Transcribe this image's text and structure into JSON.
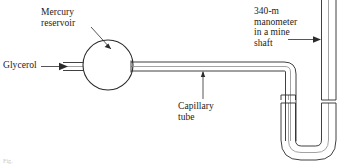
{
  "figure": {
    "labels": {
      "mercury_reservoir": "Mercury\nreservoir",
      "glycerol": "Glycerol",
      "capillary_tube": "Capillary\ntube",
      "manometer": "340-m\nmanometer\nin a mine\nshaft",
      "footer": "Fig."
    },
    "colors": {
      "line": "#2b2b2b",
      "tube_core": "#8c8c8c",
      "background": "#ffffff",
      "text": "#1a1a1a"
    },
    "geometry": {
      "reservoir_center_x": 108,
      "reservoir_center_y": 65,
      "reservoir_radius": 25,
      "capillary_top_y": 62,
      "capillary_bottom_y": 71,
      "bend_x": 292,
      "u_bottom_y": 155,
      "right_leg_x": 329
    }
  }
}
